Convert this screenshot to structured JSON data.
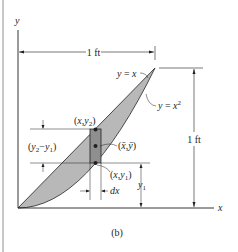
{
  "figure": {
    "caption": "(b)",
    "axes": {
      "x_label": "x",
      "y_label": "y"
    },
    "curves": {
      "upper": {
        "label": "y = x",
        "equation": "y = x"
      },
      "lower": {
        "label": "y = x²",
        "equation": "y = x^2"
      }
    },
    "dimensions": {
      "width": "1 ft",
      "height": "1 ft",
      "strip_height": "(y₂−y₁)",
      "strip_width": "dx",
      "lower_offset": "y₁"
    },
    "points": {
      "top": "(x,y₂)",
      "centroid": "(x̄,ȳ)",
      "bottom": "(x,y₁)"
    },
    "colors": {
      "shaded_region": "#b8b8b8",
      "strip": "#8f8f8f",
      "line": "#231f20",
      "frame": "#c8c8c8"
    }
  }
}
